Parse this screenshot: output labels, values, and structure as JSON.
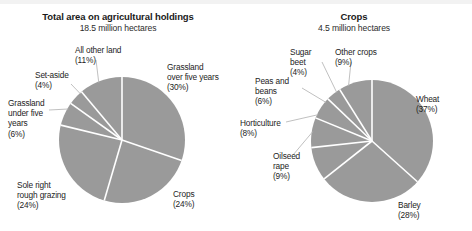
{
  "figure": {
    "width": 472,
    "height": 231,
    "background": "#ffffff",
    "slice_color": "#9a9a9a",
    "separator_color": "#ffffff",
    "leader_color": "#b9b9b9",
    "text_color": "#1d1d1d"
  },
  "chart_data": [
    {
      "type": "pie",
      "id": "total-area",
      "title": "Total area on agricultural holdings",
      "subtitle": "18.5 million hectares",
      "total_label": "18.5 million hectares",
      "units": "million hectares",
      "total_value": 18.5,
      "legend": "none",
      "categories": [
        "Grassland over five years",
        "Crops",
        "Sole right rough grazing",
        "Grassland under five years",
        "Set-aside",
        "All other land"
      ],
      "values": [
        30,
        24,
        24,
        6,
        4,
        11
      ],
      "labels": [
        "Grassland\nover five years\n(30%)",
        "Crops\n(24%)",
        "Sole right\nrough grazing\n(24%)",
        "Grassland\nunder five\nyears\n(6%)",
        "Set-aside\n(4%)",
        "All other land\n(11%)"
      ]
    },
    {
      "type": "pie",
      "id": "crops",
      "title": "Crops",
      "subtitle": "4.5 million hectares",
      "total_label": "4.5 million hectares",
      "units": "million hectares",
      "total_value": 4.5,
      "legend": "none",
      "categories": [
        "Wheat",
        "Barley",
        "Oilseed rape",
        "Horticulture",
        "Peas and beans",
        "Sugar beet",
        "Other crops"
      ],
      "values": [
        37,
        28,
        9,
        8,
        6,
        4,
        9
      ],
      "labels": [
        "Wheat\n(37%)",
        "Barley\n(28%)",
        "Oilseed\nrape\n(9%)",
        "Horticulture\n(8%)",
        "Peas and\nbeans\n(6%)",
        "Sugar\nbeet\n(4%)",
        "Other crops\n(9%)"
      ]
    }
  ],
  "left_chart": {
    "title": "Total area on agricultural holdings",
    "subtitle": "18.5 million hectares",
    "labels": {
      "grassland_over_five": "Grassland\nover five years\n(30%)",
      "crops": "Crops\n(24%)",
      "sole_right": "Sole right\nrough grazing\n(24%)",
      "grassland_under_five": "Grassland\nunder five\nyears\n(6%)",
      "set_aside": "Set-aside\n(4%)",
      "all_other_land": "All other land\n(11%)"
    }
  },
  "right_chart": {
    "title": "Crops",
    "subtitle": "4.5 million hectares",
    "labels": {
      "wheat": "Wheat\n(37%)",
      "barley": "Barley\n(28%)",
      "oilseed_rape": "Oilseed\nrape\n(9%)",
      "horticulture": "Horticulture\n(8%)",
      "peas_and_beans": "Peas and\nbeans\n(6%)",
      "sugar_beet": "Sugar\nbeet\n(4%)",
      "other_crops": "Other crops\n(9%)"
    }
  }
}
